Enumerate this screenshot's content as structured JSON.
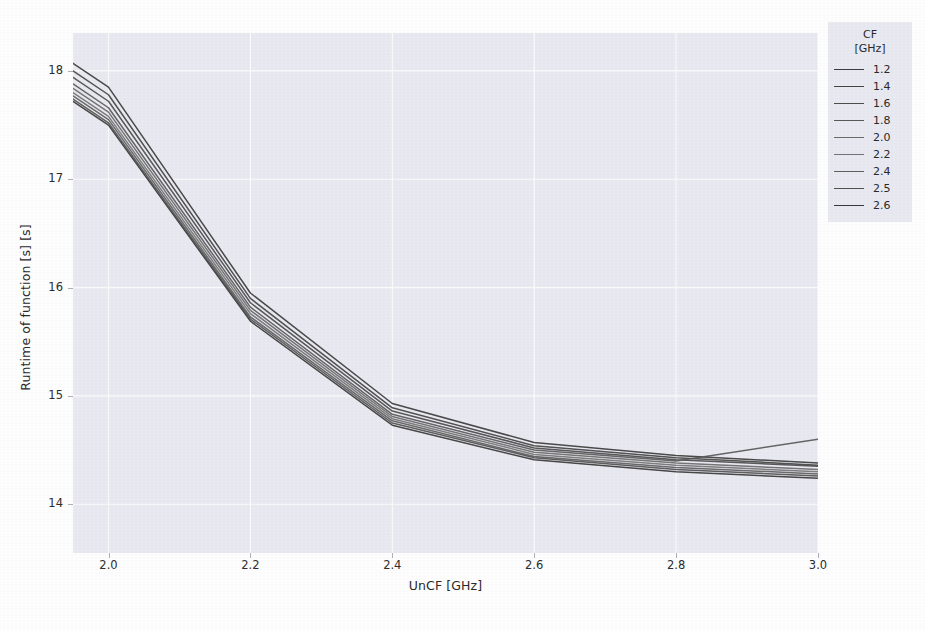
{
  "chart_data": {
    "type": "line",
    "title": "",
    "xlabel": "UnCF [GHz]",
    "ylabel": "Runtime of function [s] [s]",
    "xlim": [
      1.95,
      3.0
    ],
    "ylim": [
      13.55,
      18.35
    ],
    "xticks": [
      "2.0",
      "2.2",
      "2.4",
      "2.6",
      "2.8",
      "3.0"
    ],
    "xtick_values": [
      2.0,
      2.2,
      2.4,
      2.6,
      2.8,
      3.0
    ],
    "yticks": [
      "14",
      "15",
      "16",
      "17",
      "18"
    ],
    "ytick_values": [
      14,
      15,
      16,
      17,
      18
    ],
    "grid": true,
    "grid_color": "#ffffff",
    "panel_color": "#eaeaf2",
    "legend_position": "right-outside",
    "legend_title": "CF\n[GHz]",
    "legend_title_line1": "CF",
    "legend_title_line2": "[GHz]",
    "x": [
      1.95,
      2.0,
      2.2,
      2.4,
      2.6,
      2.8,
      3.0
    ],
    "series": [
      {
        "name": "1.2",
        "color": "#3d3d3d",
        "values": [
          18.07,
          17.85,
          15.95,
          14.93,
          14.57,
          14.45,
          14.38
        ]
      },
      {
        "name": "1.4",
        "color": "#454545",
        "values": [
          18.0,
          17.78,
          15.9,
          14.89,
          14.54,
          14.43,
          14.36
        ]
      },
      {
        "name": "1.6",
        "color": "#4d4d4d",
        "values": [
          17.94,
          17.72,
          15.86,
          14.86,
          14.52,
          14.41,
          14.35
        ]
      },
      {
        "name": "1.8",
        "color": "#5a5a5a",
        "values": [
          17.88,
          17.66,
          15.82,
          14.83,
          14.5,
          14.4,
          14.6
        ]
      },
      {
        "name": "2.0",
        "color": "#6b6b6b",
        "values": [
          17.84,
          17.62,
          15.79,
          14.81,
          14.48,
          14.38,
          14.32
        ]
      },
      {
        "name": "2.2",
        "color": "#757575",
        "values": [
          17.8,
          17.58,
          15.76,
          14.79,
          14.46,
          14.36,
          14.3
        ]
      },
      {
        "name": "2.4",
        "color": "#606060",
        "values": [
          17.77,
          17.55,
          15.73,
          14.77,
          14.44,
          14.34,
          14.28
        ]
      },
      {
        "name": "2.5",
        "color": "#525252",
        "values": [
          17.74,
          17.52,
          15.71,
          14.75,
          14.43,
          14.32,
          14.26
        ]
      },
      {
        "name": "2.6",
        "color": "#3a3a3a",
        "values": [
          17.72,
          17.5,
          15.69,
          14.73,
          14.41,
          14.3,
          14.24
        ]
      }
    ]
  }
}
